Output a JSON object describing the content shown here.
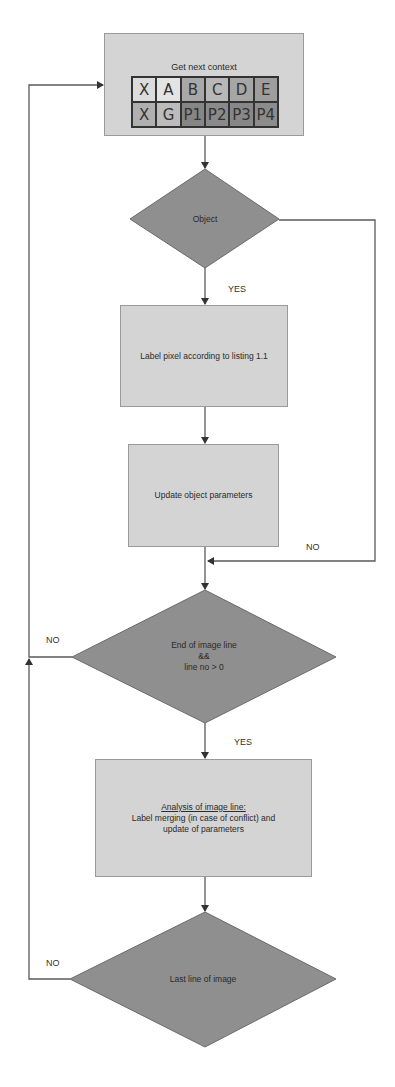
{
  "diagram": {
    "type": "flowchart",
    "colors": {
      "box_fill": "#d4d4d4",
      "diamond_fill": "#8f8f8f",
      "line": "#555555"
    },
    "start_box": {
      "title": "Get next context",
      "grid": {
        "rows": [
          [
            {
              "label": "X",
              "fill": "#dcdcdc"
            },
            {
              "label": "A",
              "fill": "#e4e4e4"
            },
            {
              "label": "B",
              "fill": "#a8a8a8"
            },
            {
              "label": "C",
              "fill": "#b8b8b8"
            },
            {
              "label": "D",
              "fill": "#a6a6a6"
            },
            {
              "label": "E",
              "fill": "#9e9e9e"
            }
          ],
          [
            {
              "label": "X",
              "fill": "#b0b0b0"
            },
            {
              "label": "G",
              "fill": "#bcbcbc"
            },
            {
              "label": "P1",
              "fill": "#868686"
            },
            {
              "label": "P2",
              "fill": "#8a8a8a"
            },
            {
              "label": "P3",
              "fill": "#888888"
            },
            {
              "label": "P4",
              "fill": "#8c8c8c"
            }
          ]
        ]
      }
    },
    "nodes": {
      "decision_object": "Object",
      "label_pixel": "Label pixel according to listing 1.1",
      "update_params": "Update object parameters",
      "decision_end_line": {
        "line1": "End of image line",
        "line2": "&&",
        "line3": "line no > 0"
      },
      "analysis": {
        "heading": "Analysis of image line:",
        "body": "Label merging (in case of conflict) and update of parameters"
      },
      "decision_last_line": "Last line of image"
    },
    "edge_labels": {
      "object_yes": "YES",
      "object_no": "NO",
      "end_line_no": "NO",
      "end_line_yes": "YES",
      "last_line_no": "NO"
    }
  }
}
